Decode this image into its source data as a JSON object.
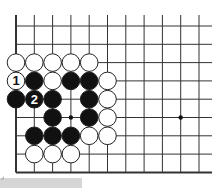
{
  "diagram": {
    "type": "go-board-fragment",
    "columns": 11,
    "rows": 9,
    "edges": [
      "left",
      "bottom"
    ],
    "star_points": [
      [
        3,
        5
      ],
      [
        9,
        5
      ]
    ],
    "stones": [
      {
        "col": 0,
        "row": 2,
        "color": "white"
      },
      {
        "col": 1,
        "row": 2,
        "color": "white"
      },
      {
        "col": 2,
        "row": 2,
        "color": "white"
      },
      {
        "col": 3,
        "row": 2,
        "color": "white"
      },
      {
        "col": 4,
        "row": 2,
        "color": "white"
      },
      {
        "col": 0,
        "row": 3,
        "color": "white",
        "label": "1"
      },
      {
        "col": 1,
        "row": 3,
        "color": "black"
      },
      {
        "col": 2,
        "row": 3,
        "color": "white"
      },
      {
        "col": 3,
        "row": 3,
        "color": "black"
      },
      {
        "col": 4,
        "row": 3,
        "color": "black"
      },
      {
        "col": 5,
        "row": 3,
        "color": "white"
      },
      {
        "col": 0,
        "row": 4,
        "color": "black"
      },
      {
        "col": 1,
        "row": 4,
        "color": "black",
        "label": "2"
      },
      {
        "col": 2,
        "row": 4,
        "color": "black"
      },
      {
        "col": 4,
        "row": 4,
        "color": "black"
      },
      {
        "col": 5,
        "row": 4,
        "color": "white"
      },
      {
        "col": 2,
        "row": 5,
        "color": "black"
      },
      {
        "col": 4,
        "row": 5,
        "color": "black"
      },
      {
        "col": 5,
        "row": 5,
        "color": "white"
      },
      {
        "col": 1,
        "row": 6,
        "color": "black"
      },
      {
        "col": 2,
        "row": 6,
        "color": "black"
      },
      {
        "col": 3,
        "row": 6,
        "color": "black"
      },
      {
        "col": 4,
        "row": 6,
        "color": "white"
      },
      {
        "col": 5,
        "row": 6,
        "color": "white"
      },
      {
        "col": 1,
        "row": 7,
        "color": "white"
      },
      {
        "col": 2,
        "row": 7,
        "color": "white"
      },
      {
        "col": 3,
        "row": 7,
        "color": "white"
      }
    ],
    "colors": {
      "line": "#333333",
      "black_stone": "#111111",
      "white_stone": "#ffffff",
      "stone_outline": "#222222",
      "label_on_white": "#111111",
      "label_on_black": "#ffffff"
    }
  }
}
